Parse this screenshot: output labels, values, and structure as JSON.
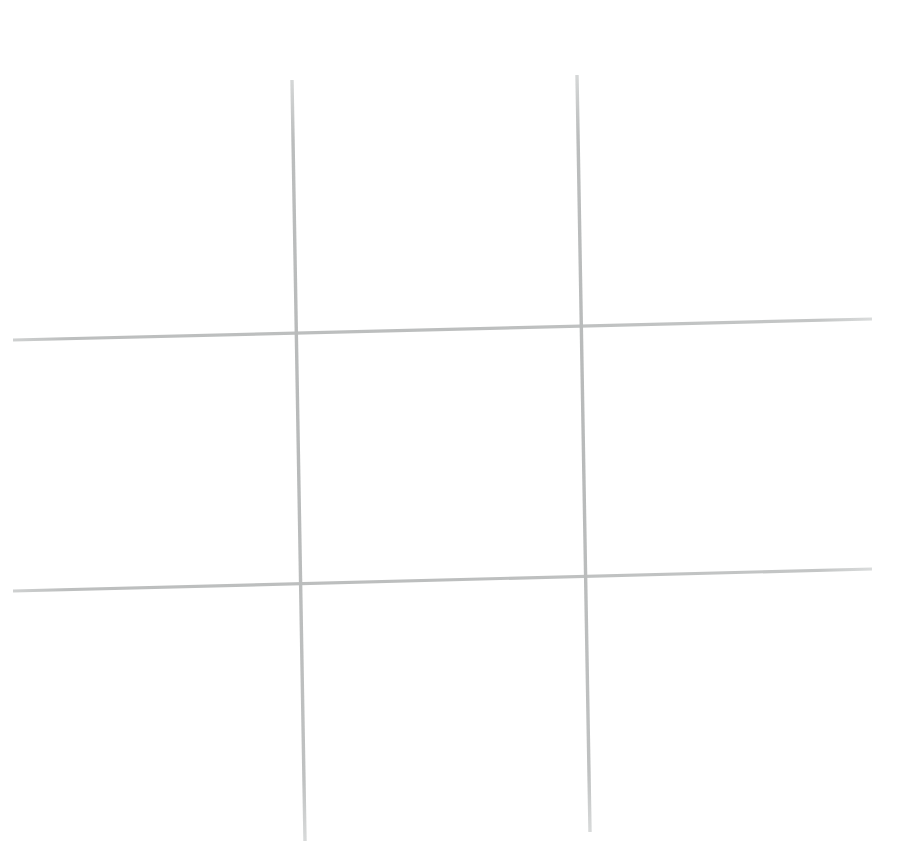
{
  "canvas": {
    "width": 899,
    "height": 852,
    "background_color": "#ffffff",
    "title": "Hand-drawn tic-tac-toe grid"
  },
  "drawing": {
    "name": "tic-tac-toe-grid",
    "stroke_color": "#b9bbbb",
    "stroke_color_light": "#cfd1d1",
    "stroke_width": 3.2,
    "strokes": [
      {
        "name": "vertical-line-left",
        "orientation": "vertical",
        "x1": 292,
        "y1": 80,
        "x2": 305,
        "y2": 841,
        "width": 3.4,
        "color": "#bcbebe"
      },
      {
        "name": "vertical-line-right",
        "orientation": "vertical",
        "x1": 577,
        "y1": 75,
        "x2": 590,
        "y2": 832,
        "width": 3.4,
        "color": "#bcbebe"
      },
      {
        "name": "horizontal-line-top",
        "orientation": "horizontal",
        "x1": 13,
        "y1": 340,
        "x2": 872,
        "y2": 319,
        "width": 3.2,
        "color": "#c2c4c4"
      },
      {
        "name": "horizontal-line-bottom",
        "orientation": "horizontal",
        "x1": 13,
        "y1": 591,
        "x2": 872,
        "y2": 569,
        "width": 3.2,
        "color": "#c2c4c4"
      }
    ],
    "intersections": [
      {
        "name": "intersection-top-left",
        "x": 297,
        "y": 329
      },
      {
        "name": "intersection-top-right",
        "x": 583,
        "y": 323
      },
      {
        "name": "intersection-bottom-left",
        "x": 301,
        "y": 580
      },
      {
        "name": "intersection-bottom-right",
        "x": 587,
        "y": 574
      }
    ]
  }
}
